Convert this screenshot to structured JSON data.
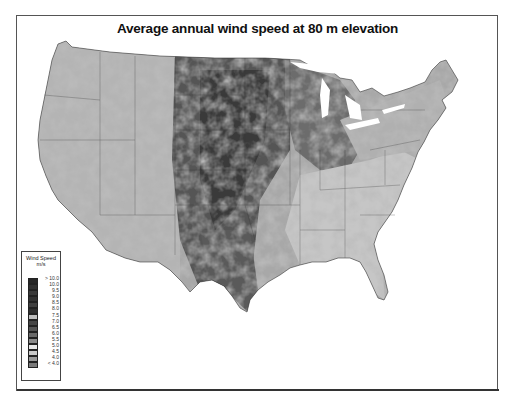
{
  "map": {
    "title": "Average annual wind speed at 80 m elevation",
    "region": "Contiguous United States",
    "style": "grayscale"
  },
  "legend": {
    "title_line1": "Wind Speed",
    "title_line2": "m/s",
    "items": [
      {
        "label": "> 10.0",
        "shade": "#262626"
      },
      {
        "label": "10.0",
        "shade": "#303030"
      },
      {
        "label": "9.5",
        "shade": "#3a3a3a"
      },
      {
        "label": "9.0",
        "shade": "#333333"
      },
      {
        "label": "8.5",
        "shade": "#404040"
      },
      {
        "label": "8.0",
        "shade": "#2e2e2e"
      },
      {
        "label": "7.5",
        "shade": "#bdbdbd"
      },
      {
        "label": "7.0",
        "shade": "#454545"
      },
      {
        "label": "6.5",
        "shade": "#555555"
      },
      {
        "label": "6.0",
        "shade": "#6a6a6a"
      },
      {
        "label": "5.5",
        "shade": "#8a8a8a"
      },
      {
        "label": "5.0",
        "shade": "#e6e6e6"
      },
      {
        "label": "4.5",
        "shade": "#c8c8c8"
      },
      {
        "label": "4.0",
        "shade": "#9a9a9a"
      },
      {
        "label": "< 4.0",
        "shade": "#7a7a7a"
      }
    ]
  }
}
